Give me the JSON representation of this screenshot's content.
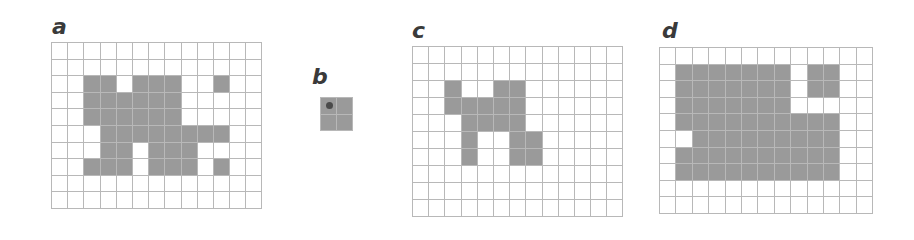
{
  "fill_color": "#9a9a9a",
  "line_color": "#b8b8b8",
  "panels": [
    {
      "label": "a",
      "cols": 13,
      "rows": 10,
      "x": 51,
      "y": 42,
      "cell_w": 16.2,
      "cell_h": 16.6,
      "label_x": 52,
      "label_y": 16,
      "filled": [
        [
          2,
          2
        ],
        [
          2,
          3
        ],
        [
          2,
          5
        ],
        [
          2,
          6
        ],
        [
          2,
          7
        ],
        [
          2,
          10
        ],
        [
          3,
          2
        ],
        [
          3,
          3
        ],
        [
          3,
          4
        ],
        [
          3,
          5
        ],
        [
          3,
          6
        ],
        [
          3,
          7
        ],
        [
          4,
          2
        ],
        [
          4,
          3
        ],
        [
          4,
          4
        ],
        [
          4,
          5
        ],
        [
          4,
          6
        ],
        [
          4,
          7
        ],
        [
          5,
          3
        ],
        [
          5,
          4
        ],
        [
          5,
          5
        ],
        [
          5,
          6
        ],
        [
          5,
          7
        ],
        [
          5,
          8
        ],
        [
          5,
          9
        ],
        [
          5,
          10
        ],
        [
          6,
          3
        ],
        [
          6,
          4
        ],
        [
          6,
          6
        ],
        [
          6,
          7
        ],
        [
          6,
          8
        ],
        [
          7,
          2
        ],
        [
          7,
          3
        ],
        [
          7,
          4
        ],
        [
          7,
          6
        ],
        [
          7,
          7
        ],
        [
          7,
          8
        ],
        [
          7,
          10
        ]
      ]
    },
    {
      "label": "b",
      "cols": 2,
      "rows": 2,
      "x": 320,
      "y": 97,
      "cell_w": 16,
      "cell_h": 16.5,
      "label_x": 312,
      "label_y": 66,
      "filled": [
        [
          0,
          0
        ],
        [
          0,
          1
        ],
        [
          1,
          0
        ],
        [
          1,
          1
        ]
      ],
      "dot": {
        "row": 0,
        "col": 0,
        "color": "#4a4a4a"
      }
    },
    {
      "label": "c",
      "cols": 13,
      "rows": 10,
      "x": 412,
      "y": 46,
      "cell_w": 16.2,
      "cell_h": 17,
      "label_x": 412,
      "label_y": 20,
      "filled": [
        [
          2,
          2
        ],
        [
          2,
          5
        ],
        [
          2,
          6
        ],
        [
          3,
          2
        ],
        [
          3,
          3
        ],
        [
          3,
          4
        ],
        [
          3,
          5
        ],
        [
          3,
          6
        ],
        [
          4,
          3
        ],
        [
          4,
          4
        ],
        [
          4,
          5
        ],
        [
          4,
          6
        ],
        [
          5,
          3
        ],
        [
          5,
          6
        ],
        [
          5,
          7
        ],
        [
          6,
          3
        ],
        [
          6,
          6
        ],
        [
          6,
          7
        ]
      ]
    },
    {
      "label": "d",
      "cols": 13,
      "rows": 10,
      "x": 659,
      "y": 47,
      "cell_w": 16.4,
      "cell_h": 16.6,
      "label_x": 662,
      "label_y": 20,
      "filled": [
        [
          1,
          1
        ],
        [
          1,
          2
        ],
        [
          1,
          3
        ],
        [
          1,
          4
        ],
        [
          1,
          5
        ],
        [
          1,
          6
        ],
        [
          1,
          7
        ],
        [
          1,
          9
        ],
        [
          1,
          10
        ],
        [
          2,
          1
        ],
        [
          2,
          2
        ],
        [
          2,
          3
        ],
        [
          2,
          4
        ],
        [
          2,
          5
        ],
        [
          2,
          6
        ],
        [
          2,
          7
        ],
        [
          2,
          9
        ],
        [
          2,
          10
        ],
        [
          3,
          1
        ],
        [
          3,
          2
        ],
        [
          3,
          3
        ],
        [
          3,
          4
        ],
        [
          3,
          5
        ],
        [
          3,
          6
        ],
        [
          3,
          7
        ],
        [
          4,
          1
        ],
        [
          4,
          2
        ],
        [
          4,
          3
        ],
        [
          4,
          4
        ],
        [
          4,
          5
        ],
        [
          4,
          6
        ],
        [
          4,
          7
        ],
        [
          4,
          8
        ],
        [
          4,
          9
        ],
        [
          4,
          10
        ],
        [
          5,
          2
        ],
        [
          5,
          3
        ],
        [
          5,
          4
        ],
        [
          5,
          5
        ],
        [
          5,
          6
        ],
        [
          5,
          7
        ],
        [
          5,
          8
        ],
        [
          5,
          9
        ],
        [
          5,
          10
        ],
        [
          6,
          1
        ],
        [
          6,
          2
        ],
        [
          6,
          3
        ],
        [
          6,
          4
        ],
        [
          6,
          5
        ],
        [
          6,
          6
        ],
        [
          6,
          7
        ],
        [
          6,
          8
        ],
        [
          6,
          9
        ],
        [
          6,
          10
        ],
        [
          7,
          1
        ],
        [
          7,
          2
        ],
        [
          7,
          3
        ],
        [
          7,
          4
        ],
        [
          7,
          5
        ],
        [
          7,
          6
        ],
        [
          7,
          7
        ],
        [
          7,
          8
        ],
        [
          7,
          9
        ],
        [
          7,
          10
        ]
      ]
    }
  ]
}
